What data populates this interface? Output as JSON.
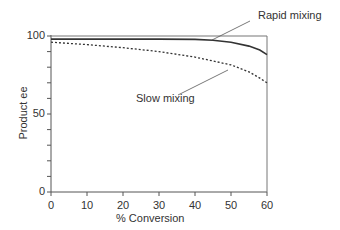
{
  "chart_data": {
    "type": "line",
    "title": "",
    "xlabel": "% Conversion",
    "ylabel": "Product ee",
    "xlim": [
      0,
      60
    ],
    "ylim": [
      0,
      100
    ],
    "x_ticks": [
      "0",
      "10",
      "20",
      "30",
      "40",
      "50",
      "60"
    ],
    "y_ticks": [
      "0",
      "50",
      "100"
    ],
    "grid": false,
    "x": [
      0,
      10,
      20,
      30,
      40,
      45,
      50,
      55,
      58,
      60
    ],
    "series": [
      {
        "name": "Rapid mixing",
        "style": "solid",
        "values": [
          98,
          98,
          98,
          98,
          97.8,
          97.3,
          96,
          93.5,
          91,
          88
        ]
      },
      {
        "name": "Slow mixing",
        "style": "dotted",
        "values": [
          96,
          94.5,
          92.5,
          90,
          86.5,
          84,
          81.5,
          77,
          73,
          70
        ]
      }
    ],
    "reference_line": {
      "y": 100,
      "style": "solid"
    },
    "annotations": [
      {
        "text": "Rapid mixing",
        "points_to": "Rapid mixing"
      },
      {
        "text": "Slow mixing",
        "points_to": "Slow mixing"
      }
    ]
  }
}
